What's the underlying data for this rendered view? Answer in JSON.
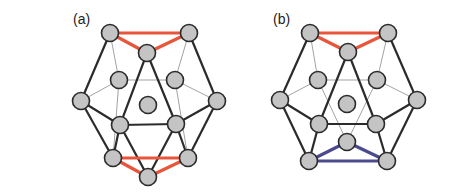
{
  "figure": {
    "panels": [
      {
        "id": "a",
        "label": "(a)",
        "label_pos": [
          73,
          24
        ],
        "nodes": {
          "TL": [
            110,
            33
          ],
          "TR": [
            189,
            33
          ],
          "TM": [
            147,
            53
          ],
          "ML": [
            119,
            80
          ],
          "MR": [
            175,
            80
          ],
          "OL": [
            81,
            101
          ],
          "OR": [
            217,
            101
          ],
          "C": [
            148,
            105
          ],
          "LML": [
            120,
            125
          ],
          "LMR": [
            176,
            124
          ],
          "BL": [
            113,
            158
          ],
          "BR": [
            188,
            158
          ],
          "BC": [
            148,
            177
          ]
        },
        "thick_edges": [
          [
            "TL",
            "OL"
          ],
          [
            "TR",
            "OR"
          ],
          [
            "TM",
            "LML"
          ],
          [
            "TM",
            "LMR"
          ],
          [
            "OL",
            "LML"
          ],
          [
            "OR",
            "LMR"
          ],
          [
            "OL",
            "BL"
          ],
          [
            "OR",
            "BR"
          ],
          [
            "LML",
            "LMR"
          ],
          [
            "LML",
            "BC"
          ],
          [
            "LMR",
            "BC"
          ],
          [
            "LML",
            "BL"
          ],
          [
            "LMR",
            "BR"
          ]
        ],
        "thin_edges": [
          [
            "TL",
            "ML"
          ],
          [
            "TR",
            "MR"
          ],
          [
            "ML",
            "MR"
          ],
          [
            "ML",
            "OL"
          ],
          [
            "MR",
            "OR"
          ],
          [
            "ML",
            "BL"
          ],
          [
            "MR",
            "BR"
          ]
        ],
        "highlight_edges": [
          {
            "from": "TL",
            "to": "TR",
            "color": "#e8553a"
          },
          {
            "from": "TL",
            "to": "TM",
            "color": "#e8553a"
          },
          {
            "from": "TR",
            "to": "TM",
            "color": "#e8553a"
          },
          {
            "from": "BL",
            "to": "BR",
            "color": "#e8553a"
          },
          {
            "from": "BL",
            "to": "BC",
            "color": "#e8553a"
          },
          {
            "from": "BR",
            "to": "BC",
            "color": "#e8553a"
          }
        ]
      },
      {
        "id": "b",
        "label": "(b)",
        "label_pos": [
          273,
          24
        ],
        "nodes": {
          "TL": [
            310,
            33
          ],
          "TR": [
            388,
            33
          ],
          "TM": [
            348,
            52
          ],
          "ML": [
            318,
            80
          ],
          "MR": [
            377,
            80
          ],
          "OL": [
            280,
            100
          ],
          "OR": [
            417,
            100
          ],
          "C": [
            347,
            104
          ],
          "LML": [
            319,
            124
          ],
          "LMR": [
            376,
            124
          ],
          "BC": [
            347,
            142
          ],
          "BL": [
            309,
            161
          ],
          "BR": [
            387,
            161
          ]
        },
        "thick_edges": [
          [
            "TL",
            "OL"
          ],
          [
            "TR",
            "OR"
          ],
          [
            "TM",
            "LML"
          ],
          [
            "TM",
            "LMR"
          ],
          [
            "OL",
            "LML"
          ],
          [
            "OR",
            "LMR"
          ],
          [
            "OL",
            "BL"
          ],
          [
            "OR",
            "BR"
          ],
          [
            "LML",
            "LMR"
          ],
          [
            "LML",
            "BL"
          ],
          [
            "LMR",
            "BR"
          ]
        ],
        "thin_edges": [
          [
            "TL",
            "ML"
          ],
          [
            "TR",
            "MR"
          ],
          [
            "ML",
            "MR"
          ],
          [
            "ML",
            "OL"
          ],
          [
            "MR",
            "OR"
          ],
          [
            "ML",
            "BC"
          ],
          [
            "MR",
            "BC"
          ]
        ],
        "highlight_edges": [
          {
            "from": "TL",
            "to": "TR",
            "color": "#e8553a"
          },
          {
            "from": "TL",
            "to": "TM",
            "color": "#e8553a"
          },
          {
            "from": "TR",
            "to": "TM",
            "color": "#e8553a"
          },
          {
            "from": "BL",
            "to": "BR",
            "color": "#4b4a8e"
          },
          {
            "from": "BL",
            "to": "BC",
            "color": "#4b4a8e"
          },
          {
            "from": "BR",
            "to": "BC",
            "color": "#4b4a8e"
          }
        ]
      }
    ],
    "colors": {
      "node_fill": "#c4c4c4",
      "node_stroke": "#2b2b2b",
      "edge_thick": "#2b2b2b",
      "edge_thin": "#8a8a8a",
      "highlight_red": "#e8553a",
      "highlight_purple": "#4b4a8e"
    },
    "node_radius": 8.5
  }
}
